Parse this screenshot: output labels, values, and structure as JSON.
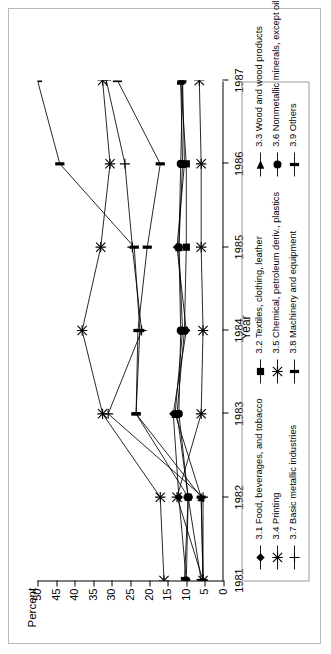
{
  "chart_data": {
    "type": "line",
    "title": "",
    "xlabel": "Year",
    "ylabel": "Percent",
    "categories": [
      "1981",
      "1982",
      "1983",
      "1984",
      "1985",
      "1986",
      "1987"
    ],
    "x": [
      1981,
      1982,
      1983,
      1984,
      1985,
      1986,
      1987
    ],
    "ylim": [
      0,
      50
    ],
    "yticks": [
      0,
      5,
      10,
      15,
      20,
      25,
      30,
      35,
      40,
      45,
      50
    ],
    "grid": false,
    "legend_position": "bottom",
    "series": [
      {
        "name": "3.1 Food, beverages, and tobacco",
        "code": "3.1",
        "marker": "diamond",
        "values": [
          10.0,
          12.0,
          13.5,
          10.0,
          12.5,
          10.5,
          11.0
        ]
      },
      {
        "name": "3.2 Textiles, clothing, leather",
        "code": "3.2",
        "marker": "square",
        "values": [
          10.5,
          9.5,
          12.5,
          10.5,
          10.0,
          10.0,
          11.5
        ]
      },
      {
        "name": "3.3 Wood and wood products",
        "code": "3.3",
        "marker": "triangle",
        "values": [
          5.5,
          6.0,
          13.0,
          11.0,
          12.0,
          11.0,
          11.5
        ]
      },
      {
        "name": "3.4 Printing",
        "code": "3.4",
        "marker": "star",
        "values": [
          16.0,
          17.0,
          32.5,
          38.0,
          33.0,
          30.5,
          32.5
        ]
      },
      {
        "name": "3.5 Chemical, petroleum deriv., plastics",
        "code": "3.5",
        "marker": "star",
        "values": [
          5.5,
          12.5,
          6.0,
          5.5,
          6.0,
          6.0,
          6.5
        ]
      },
      {
        "name": "3.6 Nonmetallic minerals, except oil products",
        "code": "3.6",
        "marker": "circle",
        "values": [
          10.0,
          9.5,
          12.0,
          11.5,
          12.0,
          11.5,
          11.0
        ]
      },
      {
        "name": "3.7 Basic metallic industries",
        "code": "3.7",
        "marker": "plus",
        "values": [
          5.5,
          5.5,
          31.0,
          22.0,
          24.5,
          26.5,
          31.5
        ]
      },
      {
        "name": "3.8 Machinery and equipment",
        "code": "3.8",
        "marker": "bar",
        "values": [
          5.5,
          6.0,
          23.5,
          23.0,
          20.5,
          17.0,
          28.5
        ]
      },
      {
        "name": "3.9 Others",
        "code": "3.9",
        "marker": "bar",
        "values": [
          6.0,
          9.5,
          23.5,
          22.5,
          24.0,
          44.0,
          50.0
        ]
      }
    ]
  },
  "axes": {
    "y_title": "Percent",
    "x_title": "Year",
    "y_tick_labels": [
      "50",
      "45",
      "40",
      "35",
      "30",
      "25",
      "20",
      "15",
      "10",
      "5",
      "0"
    ],
    "x_tick_labels": [
      "1981",
      "1982",
      "1983",
      "1984",
      "1985",
      "1986",
      "1987"
    ]
  },
  "legend": {
    "columns": [
      {
        "entries": [
          {
            "label": "3.1 Food, beverages, and tobacco",
            "marker": "diamond"
          },
          {
            "label": "3.4 Printing",
            "marker": "star"
          },
          {
            "label": "3.7 Basic metallic industries",
            "marker": "plus"
          }
        ]
      },
      {
        "entries": [
          {
            "label": "3.2 Textiles, clothing, leather",
            "marker": "square"
          },
          {
            "label": "3.5 Chemical, petroleum deriv., plastics",
            "marker": "star"
          },
          {
            "label": "3.8 Machinery and equipment",
            "marker": "bar"
          }
        ]
      },
      {
        "entries": [
          {
            "label": "3.3 Wood and wood products",
            "marker": "triangle"
          },
          {
            "label": "3.6 Nonmetallic minerals, except oil products",
            "marker": "circle"
          },
          {
            "label": "3.9 Others",
            "marker": "bar"
          }
        ]
      }
    ]
  },
  "colors": {
    "ink": "#000000",
    "frame": "#b9b9b9",
    "legend_border": "#9a9a9a",
    "background": "#ffffff"
  }
}
